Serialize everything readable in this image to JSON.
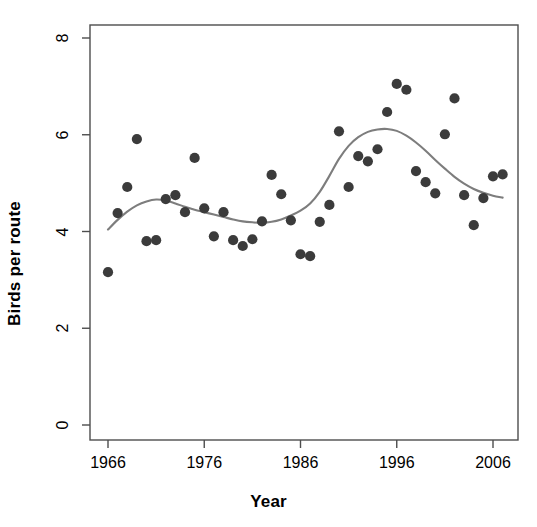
{
  "chart_data": {
    "type": "scatter",
    "title": "",
    "xlabel": "Year",
    "ylabel": "Birds per route",
    "xlim": [
      1964.2,
      1968.9
    ],
    "ylim": [
      0,
      8.55
    ],
    "xticks": [
      1966,
      1976,
      1986,
      1996,
      2006
    ],
    "xtick_labels": [
      "1966",
      "1976",
      "1986",
      "1996",
      "2006"
    ],
    "yticks": [
      0,
      2,
      4,
      6,
      8
    ],
    "ytick_labels": [
      "0",
      "2",
      "4",
      "6",
      "8"
    ],
    "grid": false,
    "legend": null,
    "point_color": "#3b3b3b",
    "line_color": "#7d7d7d",
    "axis_color": "#4d4d4d",
    "x": [
      1966,
      1967,
      1968,
      1969,
      1970,
      1971,
      1972,
      1973,
      1974,
      1975,
      1976,
      1977,
      1978,
      1979,
      1980,
      1981,
      1982,
      1983,
      1984,
      1985,
      1986,
      1987,
      1988,
      1989,
      1990,
      1991,
      1992,
      1993,
      1994,
      1995,
      1996,
      1997,
      1998,
      1999,
      2000,
      2001,
      2002,
      2003,
      2004,
      2005,
      2006,
      2007
    ],
    "y": [
      3.16,
      4.38,
      4.92,
      5.91,
      3.8,
      3.82,
      4.67,
      4.75,
      4.4,
      5.52,
      4.48,
      3.9,
      4.4,
      3.82,
      3.7,
      3.84,
      4.21,
      5.17,
      4.77,
      4.23,
      3.53,
      3.49,
      4.2,
      4.55,
      6.07,
      4.92,
      5.56,
      5.45,
      5.7,
      6.47,
      7.05,
      6.93,
      5.25,
      5.02,
      4.79,
      6.01,
      6.75,
      4.75,
      4.13,
      4.69,
      5.14,
      5.18
    ],
    "series": [
      {
        "name": "Birds per route",
        "type": "scatter",
        "marker": "filled-circle",
        "values": [
          3.16,
          4.38,
          4.92,
          5.91,
          3.8,
          3.82,
          4.67,
          4.75,
          4.4,
          5.52,
          4.48,
          3.9,
          4.4,
          3.82,
          3.7,
          3.84,
          4.21,
          5.17,
          4.77,
          4.23,
          3.53,
          3.49,
          4.2,
          4.55,
          6.07,
          4.92,
          5.56,
          5.45,
          5.7,
          6.47,
          7.05,
          6.93,
          5.25,
          5.02,
          4.79,
          6.01,
          6.75,
          4.75,
          4.13,
          4.69,
          5.14,
          5.18
        ]
      },
      {
        "name": "smoothed trend",
        "type": "line",
        "x": [
          1966,
          1967,
          1968,
          1969,
          1970,
          1971,
          1972,
          1973,
          1974,
          1975,
          1976,
          1977,
          1978,
          1979,
          1980,
          1981,
          1982,
          1983,
          1984,
          1985,
          1986,
          1987,
          1988,
          1989,
          1990,
          1991,
          1992,
          1993,
          1994,
          1995,
          1996,
          1997,
          1998,
          1999,
          2000,
          2001,
          2002,
          2003,
          2004,
          2005,
          2006,
          2007
        ],
        "values": [
          4.04,
          4.24,
          4.41,
          4.54,
          4.62,
          4.66,
          4.64,
          4.58,
          4.51,
          4.45,
          4.4,
          4.35,
          4.3,
          4.25,
          4.21,
          4.19,
          4.18,
          4.2,
          4.25,
          4.33,
          4.43,
          4.58,
          4.82,
          5.15,
          5.5,
          5.77,
          5.95,
          6.06,
          6.11,
          6.12,
          6.08,
          5.98,
          5.84,
          5.67,
          5.48,
          5.3,
          5.13,
          4.99,
          4.88,
          4.8,
          4.74,
          4.7
        ]
      }
    ]
  },
  "axes": {
    "xlabel": "Year",
    "ylabel": "Birds per route"
  }
}
